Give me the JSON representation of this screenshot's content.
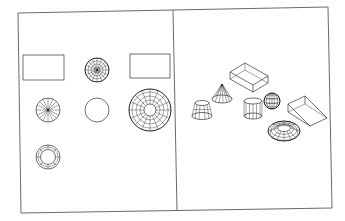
{
  "figure": {
    "panels": [
      {
        "id": "plan-view",
        "label": "Top view"
      },
      {
        "id": "isometric-view",
        "label": "Isometric view"
      }
    ],
    "colors": {
      "background": "#ffffff",
      "line": "#333333",
      "frame": "#6b6b6b"
    },
    "plan_objects": [
      "box",
      "sphere",
      "wedge",
      "cone",
      "cylinder",
      "torus",
      "truncated-cone"
    ],
    "iso_objects": [
      "truncated-cone",
      "cone",
      "box",
      "cylinder",
      "sphere",
      "wedge",
      "torus"
    ]
  }
}
